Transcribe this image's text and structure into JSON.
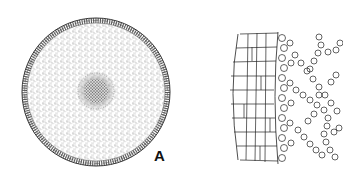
{
  "figure": {
    "panels": [
      {
        "id": "A",
        "label": "A",
        "description": "Transverse section of a cylindrical organ: outer rind of radially stacked rectangular cells, stippled parenchymatous ground tissue, dense central core"
      },
      {
        "id": "B",
        "label": "",
        "description": "Enlarged detail of the outer wall: columns of rectangular cortical cells, a band of small rounded cells, and a network of chained rounded cells enclosing large air spaces"
      }
    ],
    "colors": {
      "ink": "#222222",
      "background": "#ffffff"
    }
  }
}
